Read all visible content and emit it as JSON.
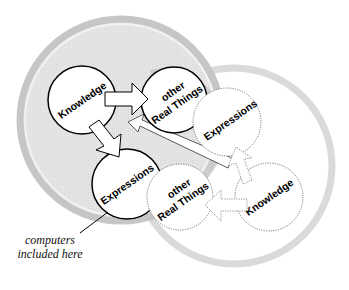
{
  "diagram": {
    "colors": {
      "background": "#ffffff",
      "left_ring": "#c4c4c4",
      "left_fill": "#e4e4e4",
      "inner_band": "#cfcfcf",
      "right_ring": "#d9d9d9",
      "right_fill": "#ffffff",
      "node_fill": "#ffffff",
      "solid_stroke": "#000000",
      "dotted_stroke": "#7a7a7a"
    },
    "left_cluster": {
      "nodes": [
        {
          "id": "knowledge",
          "label": "Knowledge"
        },
        {
          "id": "other-real-things",
          "label_line1": "other",
          "label_line2": "Real Things"
        },
        {
          "id": "expressions",
          "label": "Expressions"
        }
      ]
    },
    "right_cluster": {
      "nodes": [
        {
          "id": "expressions",
          "label": "Expressions"
        },
        {
          "id": "other-real-things",
          "label_line1": "other",
          "label_line2": "Real Things"
        },
        {
          "id": "knowledge",
          "label": "Knowledge"
        }
      ]
    },
    "annotation": {
      "line1": "computers",
      "line2": "included here"
    },
    "arrows": [
      {
        "from": "left.knowledge",
        "to": "left.other-real-things"
      },
      {
        "from": "left.knowledge",
        "to": "left.expressions"
      },
      {
        "from": "right cluster",
        "to": "left.other-real-things"
      },
      {
        "from": "right.knowledge",
        "to": "right.expressions"
      },
      {
        "from": "right.knowledge",
        "to": "right.other-real-things"
      }
    ]
  }
}
